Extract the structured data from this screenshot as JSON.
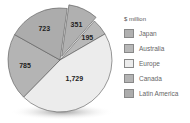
{
  "chart_data": {
    "type": "pie",
    "title": "",
    "unit_label": "$ million",
    "categories": [
      "Japan",
      "Australia",
      "Europe",
      "Canada",
      "Latin America"
    ],
    "values": [
      351,
      195,
      1729,
      785,
      723
    ],
    "value_labels": [
      "351",
      "195",
      "1,729",
      "785",
      "723"
    ],
    "colors": [
      "#b0b0b0",
      "#b8b8b8",
      "#ececec",
      "#b4b4b4",
      "#acacac"
    ],
    "exploded": [
      "Japan"
    ],
    "legend_position": "right"
  },
  "legend": {
    "title": "$ million",
    "items": [
      {
        "label": "Japan",
        "color": "#b0b0b0"
      },
      {
        "label": "Australia",
        "color": "#b8b8b8"
      },
      {
        "label": "Europe",
        "color": "#ececec"
      },
      {
        "label": "Canada",
        "color": "#b4b4b4"
      },
      {
        "label": "Latin America",
        "color": "#acacac"
      }
    ]
  }
}
